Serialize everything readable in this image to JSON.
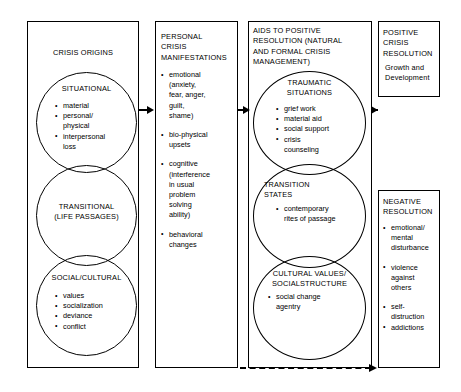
{
  "diagram": {
    "columns": {
      "origins": {
        "header": "CRISIS ORIGINS",
        "circles": [
          {
            "label": "SITUATIONAL",
            "items": [
              "material",
              "personal/\nphysical",
              "interpersonal\nloss"
            ]
          },
          {
            "label": "TRANSITIONAL\n(LIFE PASSAGES)",
            "items": []
          },
          {
            "label": "SOCIAL/CULTURAL",
            "items": [
              "values",
              "socialization",
              "deviance",
              "conflict"
            ]
          }
        ]
      },
      "manifestations": {
        "header": "PERSONAL\nCRISIS\nMANIFESTATIONS",
        "items": [
          "emotional\n(anxiety,\nfear, anger,\nguilt,\nshame)",
          "bio-physical\nupsets",
          "cognitive\n(interference\nin usual\nproblem\nsolving\nability)",
          "behavioral\nchanges"
        ]
      },
      "aids": {
        "header": "AIDS TO POSITIVE\nRESOLUTION (NATURAL\nAND FORMAL CRISIS\nMANAGEMENT)",
        "circles": [
          {
            "label": "TRAUMATIC\nSITUATIONS",
            "items": [
              "grief  work",
              "material  aid",
              "social  support",
              "crisis\ncounseling"
            ]
          },
          {
            "label": "TRANSITION\nSTATES",
            "items": [
              "contemporary\nrites of passage"
            ]
          },
          {
            "label": "CULTURAL VALUES/\nSOCIALSTRUCTURE",
            "items": [
              "social  change\nagentry"
            ]
          }
        ]
      },
      "positive": {
        "header": "POSITIVE\nCRISIS\nRESOLUTION",
        "body": "Growth  and\nDevelopment"
      },
      "negative": {
        "header": "NEGATIVE\nRESOLUTION",
        "items": [
          "emotional/\nmental\ndisturbance",
          "violence\nagainst\nothers",
          "self-\ndistruction",
          "addictions"
        ]
      }
    },
    "connectors": {
      "arrow1": "origins-to-manifestations",
      "arrow2": "manifestations-to-aids",
      "arrow3": "aids-to-positive",
      "dashed": "manifestations-to-negative"
    },
    "colors": {
      "stroke": "#000000",
      "background": "#ffffff"
    }
  }
}
